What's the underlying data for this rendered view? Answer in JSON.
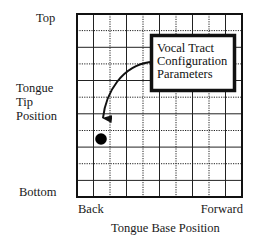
{
  "diagram": {
    "y_axis": {
      "top_label": "Top",
      "title_lines": [
        "Tongue",
        "Tip",
        "Position"
      ],
      "bottom_label": "Bottom"
    },
    "x_axis": {
      "left_label": "Back",
      "right_label": "Forward",
      "title": "Tongue Base Position"
    },
    "callout": {
      "lines": [
        "Vocal Tract",
        "Configuration",
        "Parameters"
      ]
    },
    "grid": {
      "columns": 10,
      "rows": 11,
      "line_style": "alternating solid and dotted"
    },
    "marker": {
      "shape": "filled-circle",
      "color": "#000000"
    },
    "colors": {
      "lines": "#1a1a1a",
      "background": "#ffffff"
    }
  }
}
